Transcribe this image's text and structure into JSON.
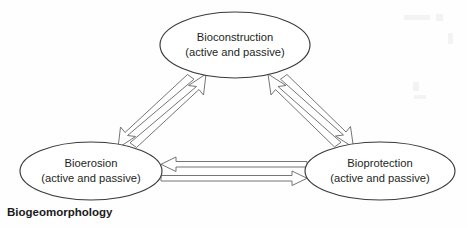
{
  "figure": {
    "caption": "Biogeomorphology",
    "background_color": "#fefefe",
    "node_stroke_color": "#3a3a3a",
    "arrow_stroke_color": "#6e6e6e",
    "text_color": "#231f20"
  },
  "nodes": [
    {
      "id": "bioconstruction",
      "title": "Bioconstruction",
      "subtitle": "(active and passive)",
      "cx": 235,
      "cy": 45,
      "rx": 75,
      "ry": 33
    },
    {
      "id": "bioerosion",
      "title": "Bioerosion",
      "subtitle": "(active and passive)",
      "cx": 91,
      "cy": 171,
      "rx": 71,
      "ry": 29
    },
    {
      "id": "bioprotection",
      "title": "Bioprotection",
      "subtitle": "(active and passive)",
      "cx": 380,
      "cy": 171,
      "rx": 75,
      "ry": 29
    }
  ],
  "connections": [
    {
      "id": "bioconstruction-to-bioerosion",
      "from": "bioconstruction",
      "to": "bioerosion",
      "direction": "down-left",
      "style": "hollow-outline-arrow"
    },
    {
      "id": "bioerosion-to-bioconstruction",
      "from": "bioerosion",
      "to": "bioconstruction",
      "direction": "up-right",
      "style": "hollow-outline-arrow"
    },
    {
      "id": "bioconstruction-to-bioprotection",
      "from": "bioconstruction",
      "to": "bioprotection",
      "direction": "down-right",
      "style": "hollow-outline-arrow"
    },
    {
      "id": "bioprotection-to-bioconstruction",
      "from": "bioprotection",
      "to": "bioconstruction",
      "direction": "up-left",
      "style": "hollow-outline-arrow"
    },
    {
      "id": "bioprotection-to-bioerosion",
      "from": "bioprotection",
      "to": "bioerosion",
      "direction": "left",
      "style": "hollow-outline-arrow"
    },
    {
      "id": "bioerosion-to-bioprotection",
      "from": "bioerosion",
      "to": "bioprotection",
      "direction": "right",
      "style": "hollow-outline-arrow"
    }
  ]
}
